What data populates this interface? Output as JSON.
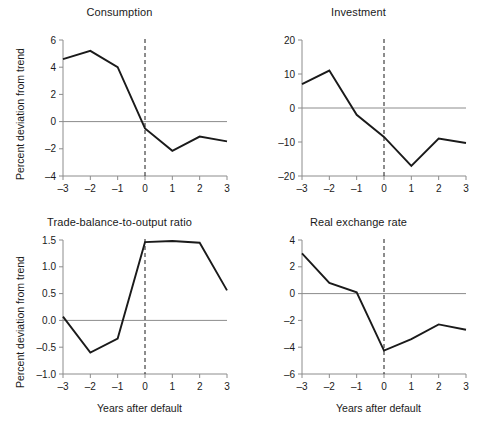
{
  "figure": {
    "width": 478,
    "height": 430,
    "background": "#ffffff",
    "line_color": "#1a1a1a",
    "axis_color": "#8c8c8c",
    "shared_xlabel": "Years after default",
    "shared_ylabel": "Percent deviation from trend"
  },
  "chart_data": [
    {
      "type": "line",
      "title": "Consumption",
      "xlabel": "",
      "ylabel": "Percent deviation from trend",
      "x": [
        -3,
        -2,
        -1,
        0,
        1,
        2,
        3
      ],
      "xtick_labels": [
        "–3",
        "–2",
        "–1",
        "0",
        "1",
        "2",
        "3"
      ],
      "values": [
        4.6,
        5.2,
        4.0,
        -0.5,
        -2.15,
        -1.1,
        -1.45
      ],
      "ylim": [
        -4,
        6
      ],
      "xlim": [
        -3,
        3
      ],
      "yticks": [
        -4,
        -2,
        0,
        2,
        4,
        6
      ],
      "ytick_labels": [
        "–4",
        "–2",
        "0",
        "2",
        "4",
        "6"
      ],
      "grid": false,
      "zero_line": true,
      "event_line_x": 0,
      "legend": "none"
    },
    {
      "type": "line",
      "title": "Investment",
      "xlabel": "",
      "ylabel": "",
      "x": [
        -3,
        -2,
        -1,
        0,
        1,
        2,
        3
      ],
      "xtick_labels": [
        "–3",
        "–2",
        "–1",
        "0",
        "1",
        "2",
        "3"
      ],
      "values": [
        7.0,
        11.0,
        -2.0,
        -8.5,
        -17.0,
        -9.0,
        -10.3
      ],
      "ylim": [
        -20,
        20
      ],
      "xlim": [
        -3,
        3
      ],
      "yticks": [
        -20,
        -10,
        0,
        10,
        20
      ],
      "ytick_labels": [
        "–20",
        "–10",
        "0",
        "10",
        "20"
      ],
      "grid": false,
      "zero_line": true,
      "event_line_x": 0,
      "legend": "none"
    },
    {
      "type": "line",
      "title": "Trade-balance-to-output ratio",
      "xlabel": "Years after default",
      "ylabel": "Percent deviation from trend",
      "x": [
        -3,
        -2,
        -1,
        0,
        1,
        2,
        3
      ],
      "xtick_labels": [
        "–3",
        "–2",
        "–1",
        "0",
        "1",
        "2",
        "3"
      ],
      "values": [
        0.07,
        -0.6,
        -0.34,
        1.46,
        1.48,
        1.45,
        0.56
      ],
      "ylim": [
        -1.0,
        1.5
      ],
      "xlim": [
        -3,
        3
      ],
      "yticks": [
        -1.0,
        -0.5,
        0.0,
        0.5,
        1.0,
        1.5
      ],
      "ytick_labels": [
        "–1.0",
        "–0.5",
        "0.0",
        "0.5",
        "1.0",
        "1.5"
      ],
      "grid": false,
      "zero_line": true,
      "event_line_x": 0,
      "legend": "none"
    },
    {
      "type": "line",
      "title": "Real exchange rate",
      "xlabel": "Years after default",
      "ylabel": "",
      "x": [
        -3,
        -2,
        -1,
        0,
        1,
        2,
        3
      ],
      "xtick_labels": [
        "–3",
        "–2",
        "–1",
        "0",
        "1",
        "2",
        "3"
      ],
      "values": [
        3.0,
        0.8,
        0.1,
        -4.25,
        -3.4,
        -2.3,
        -2.7
      ],
      "ylim": [
        -6,
        4
      ],
      "xlim": [
        -3,
        3
      ],
      "yticks": [
        -6,
        -4,
        -2,
        0,
        2,
        4
      ],
      "ytick_labels": [
        "–6",
        "–4",
        "–2",
        "0",
        "2",
        "4"
      ],
      "grid": false,
      "zero_line": true,
      "event_line_x": 0,
      "legend": "none"
    }
  ]
}
